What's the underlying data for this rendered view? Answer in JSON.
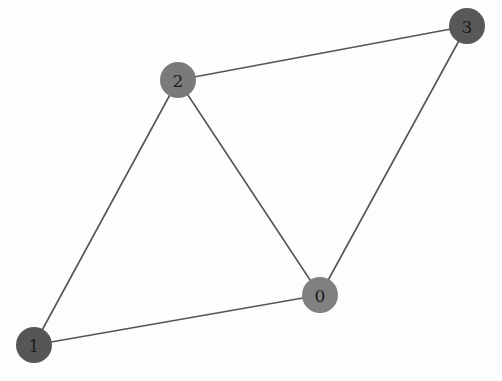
{
  "canvas": {
    "width": 502,
    "height": 381,
    "background": "#fdfdfd"
  },
  "chart_data": {
    "type": "diagram",
    "diagram_kind": "node-link-graph",
    "title": "",
    "directed": false,
    "node_radius": 18,
    "edge_color": "#555555",
    "edge_width": 1.6,
    "label_color": "#1c1c1c",
    "nodes": [
      {
        "id": "0",
        "label": "0",
        "x": 320,
        "y": 295,
        "color": "#808080",
        "radius": 18
      },
      {
        "id": "1",
        "label": "1",
        "x": 34,
        "y": 345,
        "color": "#565656",
        "radius": 18
      },
      {
        "id": "2",
        "label": "2",
        "x": 178,
        "y": 80,
        "color": "#7a7a7a",
        "radius": 18
      },
      {
        "id": "3",
        "label": "3",
        "x": 467,
        "y": 26,
        "color": "#585858",
        "radius": 18
      }
    ],
    "edges": [
      {
        "source": "1",
        "target": "2"
      },
      {
        "source": "2",
        "target": "3"
      },
      {
        "source": "2",
        "target": "0"
      },
      {
        "source": "0",
        "target": "3"
      },
      {
        "source": "0",
        "target": "1"
      }
    ],
    "node_count": 4,
    "edge_count": 5,
    "degrees": {
      "0": 3,
      "1": 2,
      "2": 3,
      "3": 2
    }
  }
}
